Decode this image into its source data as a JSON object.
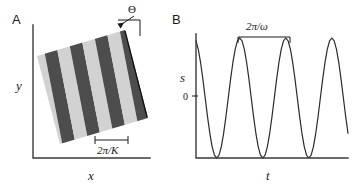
{
  "figure": {
    "panels": [
      {
        "letter": "A",
        "name": "grating-panel",
        "xlabel": "x",
        "ylabel": "y",
        "annotations": [
          {
            "name": "orientation-angle",
            "label": "Θ"
          },
          {
            "name": "spatial-period",
            "label": "2π/K"
          }
        ]
      },
      {
        "letter": "B",
        "name": "waveform-panel",
        "xlabel": "t",
        "ylabel": "s",
        "origin_tick_label": "0",
        "annotations": [
          {
            "name": "temporal-period",
            "label": "2π/ω"
          }
        ]
      }
    ]
  },
  "chart_data": {
    "type": "line",
    "title": "",
    "xlabel": "t",
    "ylabel": "s",
    "grid": false,
    "legend": false,
    "annotation": "2π/ω",
    "period_px": 84,
    "peak_count": 3,
    "xlim": [
      0,
      6.6
    ],
    "ylim": [
      0,
      1
    ],
    "tick_labels": {
      "y": [
        "0"
      ]
    },
    "x": [
      0.0,
      0.1,
      0.2,
      0.3,
      0.4,
      0.5,
      0.6,
      0.7,
      0.8,
      0.9,
      1.0,
      1.1,
      1.2,
      1.3,
      1.4,
      1.5,
      1.6,
      1.7,
      1.8,
      1.9,
      2.0,
      2.1,
      2.2,
      2.3,
      2.4,
      2.5,
      2.6,
      2.7,
      2.8,
      2.9,
      3.0,
      3.1,
      3.2,
      3.3,
      3.4,
      3.5,
      3.6,
      3.7,
      3.8,
      3.9,
      4.0,
      4.1,
      4.2,
      4.3,
      4.4,
      4.5,
      4.6,
      4.7,
      4.8,
      4.9,
      5.0,
      5.1,
      5.2,
      5.3,
      5.4,
      5.5,
      5.6,
      5.7,
      5.8,
      5.9,
      6.0,
      6.1,
      6.2,
      6.3,
      6.4,
      6.5,
      6.6
    ],
    "values": [
      0.976,
      0.905,
      0.794,
      0.655,
      0.5,
      0.345,
      0.206,
      0.095,
      0.024,
      0.0,
      0.024,
      0.095,
      0.206,
      0.345,
      0.5,
      0.655,
      0.794,
      0.905,
      0.976,
      1.0,
      0.976,
      0.905,
      0.794,
      0.655,
      0.5,
      0.345,
      0.206,
      0.095,
      0.024,
      0.0,
      0.024,
      0.095,
      0.206,
      0.345,
      0.5,
      0.655,
      0.794,
      0.905,
      0.976,
      1.0,
      0.976,
      0.905,
      0.794,
      0.655,
      0.5,
      0.345,
      0.206,
      0.095,
      0.024,
      0.0,
      0.024,
      0.095,
      0.206,
      0.345,
      0.5,
      0.655,
      0.794,
      0.905,
      0.976,
      1.0,
      0.976,
      0.905,
      0.794,
      0.655,
      0.5,
      0.345,
      0.206
    ]
  },
  "grating": {
    "rotation_deg": -11,
    "stripe_count": 9,
    "dark_color": "#4d4d4d",
    "light_color": "#d2d2d2",
    "background": "#ffffff"
  }
}
